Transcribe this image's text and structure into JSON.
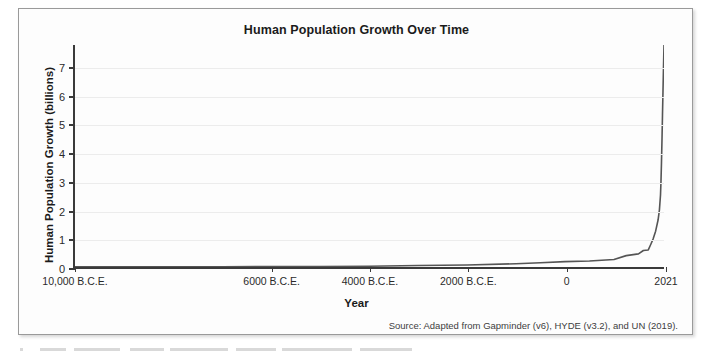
{
  "chart_data": {
    "type": "line",
    "title": "Human Population Growth Over Time",
    "xlabel": "Year",
    "ylabel": "Human Population Growth (billions)",
    "source": "Source: Adapted from Gapminder (v6), HYDE (v3.2), and UN (2019).",
    "grid": true,
    "legend": "none",
    "xlim": [
      -10000,
      2021
    ],
    "ylim": [
      0,
      7.8
    ],
    "y_ticks": [
      0,
      1,
      2,
      3,
      4,
      5,
      6,
      7
    ],
    "y_tick_labels": [
      "0",
      "1",
      "2",
      "3",
      "4",
      "5",
      "6",
      "7"
    ],
    "x_ticks": [
      -10000,
      -6000,
      -4000,
      -2000,
      0,
      2021
    ],
    "x_tick_labels": [
      "10,000 B.C.E.",
      "6000 B.C.E.",
      "4000 B.C.E.",
      "2000 B.C.E.",
      "0",
      "2021"
    ],
    "series": [
      {
        "name": "World population",
        "x": [
          -10000,
          -9000,
          -8000,
          -7000,
          -6000,
          -5000,
          -4000,
          -3000,
          -2000,
          -1000,
          -500,
          0,
          500,
          1000,
          1250,
          1500,
          1600,
          1700,
          1750,
          1800,
          1850,
          1900,
          1927,
          1950,
          1960,
          1970,
          1980,
          1990,
          2000,
          2010,
          2021
        ],
        "y": [
          0.004,
          0.005,
          0.007,
          0.01,
          0.015,
          0.02,
          0.028,
          0.05,
          0.072,
          0.115,
          0.15,
          0.19,
          0.21,
          0.265,
          0.4,
          0.46,
          0.58,
          0.6,
          0.79,
          0.99,
          1.26,
          1.65,
          2.0,
          2.54,
          3.03,
          3.7,
          4.46,
          5.33,
          6.14,
          6.96,
          7.8
        ]
      }
    ],
    "line_color": "#555555"
  },
  "card": {
    "title": "Human Population Growth Over Time",
    "source": "Source: Adapted from Gapminder (v6), HYDE (v3.2), and UN (2019)."
  }
}
